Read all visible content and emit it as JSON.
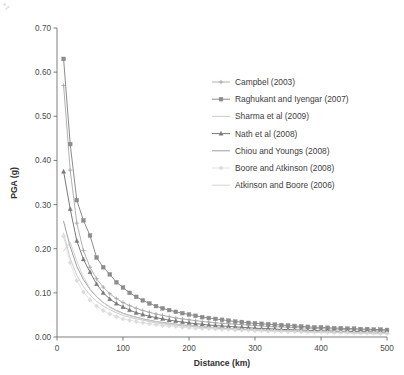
{
  "chart_data": {
    "type": "line",
    "title": "",
    "xlabel": "Distance (km)",
    "ylabel": "PGA  (g)",
    "xlim": [
      0,
      500
    ],
    "ylim": [
      0.0,
      0.7
    ],
    "xticks": [
      0,
      100,
      200,
      300,
      400,
      500
    ],
    "yticks": [
      0.0,
      0.1,
      0.2,
      0.3,
      0.4,
      0.5,
      0.6,
      0.7
    ],
    "xtick_labels": [
      "0",
      "100",
      "200",
      "300",
      "400",
      "500"
    ],
    "ytick_labels": [
      "0.00",
      "0.10",
      "0.20",
      "0.30",
      "0.40",
      "0.50",
      "0.60",
      "0.70"
    ],
    "grid": false,
    "legend_position": "upper-right-inside",
    "x": [
      10,
      20,
      30,
      40,
      50,
      60,
      70,
      80,
      90,
      100,
      110,
      120,
      130,
      140,
      150,
      160,
      170,
      180,
      190,
      200,
      210,
      220,
      230,
      240,
      250,
      260,
      270,
      280,
      290,
      300,
      310,
      320,
      330,
      340,
      350,
      360,
      370,
      380,
      390,
      400,
      410,
      420,
      430,
      440,
      450,
      460,
      470,
      480,
      490,
      500
    ],
    "series": [
      {
        "name": "Campbel (2003)",
        "color": "#a8a8a8",
        "marker": "plus",
        "line_width": 0.9,
        "values": [
          0.57,
          0.378,
          0.258,
          0.196,
          0.158,
          0.132,
          0.113,
          0.098,
          0.087,
          0.078,
          0.071,
          0.065,
          0.06,
          0.056,
          0.052,
          0.049,
          0.046,
          0.043,
          0.041,
          0.039,
          0.037,
          0.035,
          0.034,
          0.032,
          0.031,
          0.03,
          0.029,
          0.028,
          0.027,
          0.026,
          0.025,
          0.024,
          0.023,
          0.023,
          0.022,
          0.021,
          0.021,
          0.02,
          0.019,
          0.019,
          0.018,
          0.018,
          0.017,
          0.017,
          0.016,
          0.016,
          0.016,
          0.015,
          0.015,
          0.015
        ]
      },
      {
        "name": "Raghukant and Iyengar (2007)",
        "color": "#8c8c8c",
        "marker": "square",
        "line_width": 1.0,
        "values": [
          0.63,
          0.437,
          0.31,
          0.264,
          0.23,
          0.18,
          0.158,
          0.142,
          0.124,
          0.112,
          0.1,
          0.091,
          0.083,
          0.076,
          0.07,
          0.065,
          0.061,
          0.057,
          0.054,
          0.051,
          0.048,
          0.045,
          0.043,
          0.041,
          0.039,
          0.037,
          0.035,
          0.034,
          0.032,
          0.031,
          0.03,
          0.029,
          0.028,
          0.027,
          0.026,
          0.025,
          0.024,
          0.023,
          0.022,
          0.022,
          0.021,
          0.02,
          0.02,
          0.019,
          0.019,
          0.018,
          0.018,
          0.017,
          0.017,
          0.016
        ]
      },
      {
        "name": "Sharma et al (2009)",
        "color": "#c6c6c6",
        "marker": "none",
        "line_width": 0.9,
        "values": [
          0.235,
          0.178,
          0.14,
          0.114,
          0.095,
          0.081,
          0.07,
          0.062,
          0.055,
          0.049,
          0.045,
          0.041,
          0.038,
          0.035,
          0.032,
          0.03,
          0.028,
          0.027,
          0.025,
          0.024,
          0.023,
          0.022,
          0.021,
          0.02,
          0.019,
          0.018,
          0.017,
          0.017,
          0.016,
          0.015,
          0.015,
          0.014,
          0.014,
          0.013,
          0.013,
          0.013,
          0.012,
          0.012,
          0.011,
          0.011,
          0.011,
          0.01,
          0.01,
          0.01,
          0.01,
          0.009,
          0.009,
          0.009,
          0.009,
          0.008
        ]
      },
      {
        "name": "Nath et al (2008)",
        "color": "#7a7a7a",
        "marker": "triangle",
        "line_width": 1.0,
        "values": [
          0.375,
          0.29,
          0.218,
          0.176,
          0.147,
          0.12,
          0.1,
          0.086,
          0.076,
          0.068,
          0.061,
          0.055,
          0.051,
          0.047,
          0.044,
          0.041,
          0.038,
          0.036,
          0.034,
          0.032,
          0.03,
          0.029,
          0.027,
          0.026,
          0.025,
          0.024,
          0.023,
          0.022,
          0.021,
          0.02,
          0.019,
          0.019,
          0.018,
          0.017,
          0.017,
          0.016,
          0.016,
          0.015,
          0.015,
          0.014,
          0.014,
          0.013,
          0.013,
          0.013,
          0.012,
          0.012,
          0.012,
          0.011,
          0.011,
          0.011
        ]
      },
      {
        "name": "Chiou and Youngs (2008)",
        "color": "#9e9e9e",
        "marker": "none",
        "line_width": 1.0,
        "values": [
          0.262,
          0.205,
          0.16,
          0.13,
          0.108,
          0.091,
          0.078,
          0.068,
          0.06,
          0.054,
          0.049,
          0.045,
          0.041,
          0.038,
          0.035,
          0.033,
          0.031,
          0.029,
          0.027,
          0.026,
          0.024,
          0.023,
          0.022,
          0.021,
          0.02,
          0.019,
          0.018,
          0.018,
          0.017,
          0.016,
          0.016,
          0.015,
          0.015,
          0.014,
          0.014,
          0.013,
          0.013,
          0.012,
          0.012,
          0.012,
          0.011,
          0.011,
          0.011,
          0.01,
          0.01,
          0.01,
          0.01,
          0.009,
          0.009,
          0.009
        ]
      },
      {
        "name": "Boore and Atkinson (2008)",
        "color": "#dcdcdc",
        "marker": "diamond",
        "line_width": 0.8,
        "values": [
          0.228,
          0.168,
          0.128,
          0.102,
          0.084,
          0.07,
          0.06,
          0.052,
          0.046,
          0.041,
          0.038,
          0.035,
          0.032,
          0.03,
          0.028,
          0.026,
          0.025,
          0.024,
          0.022,
          0.021,
          0.02,
          0.019,
          0.019,
          0.018,
          0.017,
          0.017,
          0.016,
          0.015,
          0.015,
          0.014,
          0.014,
          0.013,
          0.013,
          0.013,
          0.012,
          0.012,
          0.012,
          0.011,
          0.011,
          0.011,
          0.01,
          0.01,
          0.01,
          0.01,
          0.009,
          0.009,
          0.009,
          0.009,
          0.008,
          0.008
        ]
      },
      {
        "name": "Atkinson and Boore (2006)",
        "color": "#cfcfcf",
        "marker": "none",
        "line_width": 0.9,
        "values": [
          0.195,
          0.215,
          0.172,
          0.136,
          0.11,
          0.092,
          0.078,
          0.067,
          0.059,
          0.053,
          0.048,
          0.044,
          0.04,
          0.037,
          0.035,
          0.032,
          0.03,
          0.029,
          0.027,
          0.026,
          0.024,
          0.023,
          0.022,
          0.021,
          0.02,
          0.019,
          0.019,
          0.018,
          0.017,
          0.017,
          0.016,
          0.015,
          0.015,
          0.014,
          0.014,
          0.014,
          0.013,
          0.013,
          0.012,
          0.012,
          0.012,
          0.011,
          0.011,
          0.011,
          0.01,
          0.01,
          0.01,
          0.01,
          0.009,
          0.009
        ]
      }
    ]
  },
  "legend": {
    "items": [
      {
        "label": "Campbel (2003)"
      },
      {
        "label": "Raghukant and Iyengar (2007)"
      },
      {
        "label": "Sharma et al (2009)"
      },
      {
        "label": "Nath et al (2008)"
      },
      {
        "label": "Chiou and Youngs (2008)"
      },
      {
        "label": "Boore and Atkinson (2008)"
      },
      {
        "label": "Atkinson and Boore (2006)"
      }
    ]
  }
}
